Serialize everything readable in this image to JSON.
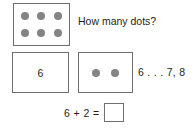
{
  "page": {
    "background_color": "#ffffff",
    "ink_color": "#231f20",
    "border_color": "#6e6e6e",
    "dot_color": "#848484"
  },
  "row1": {
    "dots_box": {
      "dot_count": 6,
      "rows": 2,
      "columns": 3,
      "dot_icon_name": "filled-dot"
    },
    "question": "How many dots?"
  },
  "row2": {
    "numeral_box": {
      "value": "6"
    },
    "dots_box": {
      "dot_count": 2,
      "rows": 1,
      "columns": 2,
      "dot_icon_name": "filled-dot"
    },
    "counting_on": "6 . . . 7, 8"
  },
  "row3": {
    "expression": "6 + 2 =",
    "answer_value": ""
  }
}
